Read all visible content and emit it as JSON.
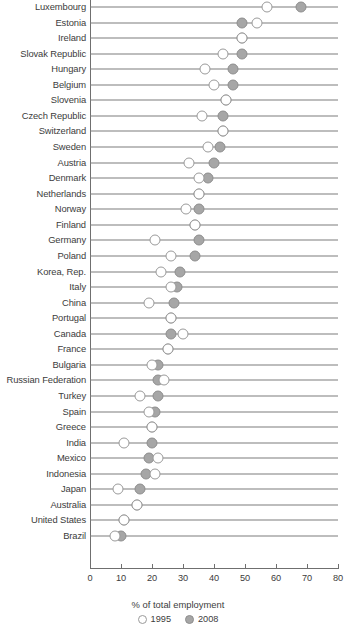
{
  "chart_data": {
    "type": "scatter",
    "subtype": "dumbbell-dot-plot",
    "title": "",
    "xlabel": "% of total employment",
    "ylabel": "",
    "xlim": [
      0,
      80
    ],
    "xticks": [
      0,
      10,
      20,
      30,
      40,
      50,
      60,
      70,
      80
    ],
    "grid": false,
    "legend_position": "bottom-center",
    "legend": [
      {
        "name": "1995",
        "marker": "open-circle",
        "color": "#ffffff",
        "border": "#9a9a9a"
      },
      {
        "name": "2008",
        "marker": "filled-circle",
        "color": "#a6a6a6",
        "border": "#8e8e8e"
      }
    ],
    "categories": [
      "Luxembourg",
      "Estonia",
      "Ireland",
      "Slovak Republic",
      "Hungary",
      "Belgium",
      "Slovenia",
      "Czech Republic",
      "Switzerland",
      "Sweden",
      "Austria",
      "Denmark",
      "Netherlands",
      "Norway",
      "Finland",
      "Germany",
      "Poland",
      "Korea, Rep.",
      "Italy",
      "China",
      "Portugal",
      "Canada",
      "France",
      "Bulgaria",
      "Russian Federation",
      "Turkey",
      "Spain",
      "Greece",
      "India",
      "Mexico",
      "Indonesia",
      "Japan",
      "Australia",
      "United States",
      "Brazil"
    ],
    "series": [
      {
        "name": "1995",
        "values": [
          57,
          54,
          49,
          43,
          37,
          40,
          44,
          36,
          43,
          38,
          32,
          35,
          35,
          31,
          34,
          21,
          26,
          23,
          26,
          19,
          26,
          30,
          25,
          20,
          24,
          16,
          19,
          20,
          11,
          22,
          21,
          9,
          15,
          11,
          8
        ]
      },
      {
        "name": "2008",
        "values": [
          68,
          49,
          49,
          49,
          46,
          46,
          44,
          43,
          43,
          42,
          40,
          38,
          35,
          35,
          34,
          35,
          34,
          29,
          28,
          27,
          26,
          26,
          25,
          22,
          22,
          22,
          21,
          20,
          20,
          19,
          18,
          16,
          15,
          11,
          10
        ]
      }
    ]
  },
  "axis": {
    "tick_labels": [
      "0",
      "10",
      "20",
      "30",
      "40",
      "50",
      "60",
      "70",
      "80"
    ],
    "x_title": "% of total employment"
  },
  "legend": {
    "items": [
      {
        "label": "1995"
      },
      {
        "label": "2008"
      }
    ]
  }
}
